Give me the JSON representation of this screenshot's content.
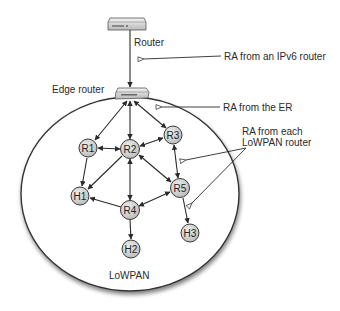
{
  "diagram": {
    "colors": {
      "line": "#2a2a2a",
      "node_fill": "#d4d4d4",
      "node_stroke": "#3a3a3a",
      "boundary": "#333333",
      "background": "#ffffff"
    },
    "devices": {
      "router": {
        "label": "Router"
      },
      "edge_router": {
        "label": "Edge router"
      }
    },
    "annotations": {
      "ra_ipv6": "RA from an IPv6 router",
      "ra_er": "RA from the ER",
      "ra_lowpan_line1": "RA from each",
      "ra_lowpan_line2": "LoWPAN router"
    },
    "region": {
      "label": "LoWPAN"
    },
    "nodes": [
      {
        "id": "R1",
        "label": "R1",
        "type": "router"
      },
      {
        "id": "R2",
        "label": "R2",
        "type": "router"
      },
      {
        "id": "R3",
        "label": "R3",
        "type": "router"
      },
      {
        "id": "R4",
        "label": "R4",
        "type": "router"
      },
      {
        "id": "R5",
        "label": "R5",
        "type": "router"
      },
      {
        "id": "H1",
        "label": "H1",
        "type": "host"
      },
      {
        "id": "H2",
        "label": "H2",
        "type": "host"
      },
      {
        "id": "H3",
        "label": "H3",
        "type": "host"
      }
    ],
    "edges": [
      {
        "from": "Router",
        "to": "Edge router",
        "dir": "forward"
      },
      {
        "from": "Edge router",
        "to": "R1",
        "dir": "both"
      },
      {
        "from": "Edge router",
        "to": "R2",
        "dir": "both"
      },
      {
        "from": "Edge router",
        "to": "R3",
        "dir": "both"
      },
      {
        "from": "R1",
        "to": "R2",
        "dir": "both"
      },
      {
        "from": "R2",
        "to": "R3",
        "dir": "both"
      },
      {
        "from": "R1",
        "to": "H1",
        "dir": "forward"
      },
      {
        "from": "R2",
        "to": "H1",
        "dir": "forward"
      },
      {
        "from": "R2",
        "to": "R4",
        "dir": "both"
      },
      {
        "from": "R2",
        "to": "R5",
        "dir": "both"
      },
      {
        "from": "R3",
        "to": "R5",
        "dir": "both"
      },
      {
        "from": "R4",
        "to": "R5",
        "dir": "both"
      },
      {
        "from": "R4",
        "to": "H1",
        "dir": "forward"
      },
      {
        "from": "R4",
        "to": "H2",
        "dir": "forward"
      },
      {
        "from": "R5",
        "to": "H3",
        "dir": "forward"
      }
    ]
  }
}
